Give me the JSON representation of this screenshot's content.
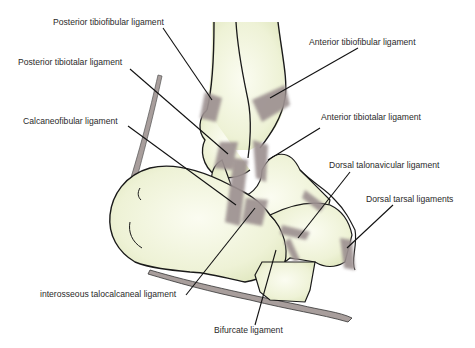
{
  "diagram": {
    "colors": {
      "bone_fill": "#eef2d6",
      "bone_outline": "#1a1a1a",
      "ligament": "#9d9191",
      "leader_line": "#111111",
      "label_text": "#2a2a2a"
    },
    "labels": [
      {
        "id": "posterior-tibiofibular",
        "text": "Posterior tibiofibular ligament"
      },
      {
        "id": "posterior-tibiotalar",
        "text": "Posterior tibiotalar ligament"
      },
      {
        "id": "calcaneofibular",
        "text": "Calcaneofibular ligament"
      },
      {
        "id": "interosseous-talocalcaneal",
        "text": "interosseous talocalcaneal ligament"
      },
      {
        "id": "bifurcate",
        "text": "Bifurcate ligament"
      },
      {
        "id": "anterior-tibiofibular",
        "text": "Anterior tibiofibular ligament"
      },
      {
        "id": "anterior-tibiotalar",
        "text": "Anterior tibiotalar ligament"
      },
      {
        "id": "dorsal-talonavicular",
        "text": "Dorsal talonavicular ligament"
      },
      {
        "id": "dorsal-tarsal",
        "text": "Dorsal tarsal ligaments"
      }
    ]
  }
}
